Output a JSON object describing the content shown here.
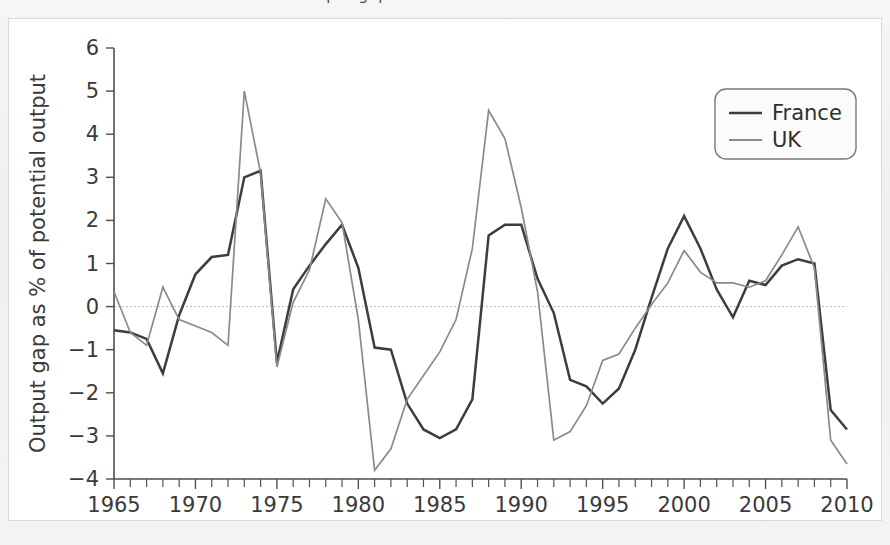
{
  "figure": {
    "cutoff_top_text": "output gap",
    "background_color": "#f2f2f2",
    "plate_color": "#ffffff"
  },
  "legend": {
    "position": "top-right",
    "entries": [
      {
        "label": "France",
        "color": "#3d3d3d",
        "width": 2.6
      },
      {
        "label": "UK",
        "color": "#8a8a8a",
        "width": 1.8
      }
    ]
  },
  "chart_data": {
    "type": "line",
    "title": "",
    "xlabel": "",
    "ylabel": "Output gap as % of potential output",
    "xlim": [
      1965,
      2010
    ],
    "ylim": [
      -4,
      6
    ],
    "grid": false,
    "zero_line": true,
    "legend_position": "top-right",
    "xticks": [
      1965,
      1970,
      1975,
      1980,
      1985,
      1990,
      1995,
      2000,
      2005,
      2010
    ],
    "xtick_labels": [
      "1965",
      "1970",
      "1975",
      "1980",
      "1985",
      "1990",
      "1995",
      "2000",
      "2005",
      "2010"
    ],
    "xminor_step": 1,
    "yticks": [
      -4,
      -3,
      -2,
      -1,
      0,
      1,
      2,
      3,
      4,
      5,
      6
    ],
    "ytick_labels": [
      "−4",
      "−3",
      "−2",
      "−1",
      "0",
      "1",
      "2",
      "3",
      "4",
      "5",
      "6"
    ],
    "x": [
      1965,
      1966,
      1967,
      1968,
      1969,
      1970,
      1971,
      1972,
      1973,
      1974,
      1975,
      1976,
      1977,
      1978,
      1979,
      1980,
      1981,
      1982,
      1983,
      1984,
      1985,
      1986,
      1987,
      1988,
      1989,
      1990,
      1991,
      1992,
      1993,
      1994,
      1995,
      1996,
      1997,
      1998,
      1999,
      2000,
      2001,
      2002,
      2003,
      2004,
      2005,
      2006,
      2007,
      2008,
      2009,
      2010
    ],
    "series": [
      {
        "name": "France",
        "color": "#3d3d3d",
        "values": [
          -0.55,
          -0.6,
          -0.75,
          -1.55,
          -0.2,
          0.75,
          1.15,
          1.2,
          3.0,
          3.15,
          -1.3,
          0.4,
          0.95,
          1.45,
          1.9,
          0.9,
          -0.95,
          -1.0,
          -2.25,
          -2.85,
          -3.05,
          -2.85,
          -2.15,
          1.65,
          1.9,
          1.9,
          0.65,
          -0.15,
          -1.7,
          -1.85,
          -2.25,
          -1.9,
          -1.0,
          0.2,
          1.35,
          2.1,
          1.35,
          0.4,
          -0.25,
          0.6,
          0.5,
          0.95,
          1.1,
          1.0,
          -2.4,
          -2.85
        ]
      },
      {
        "name": "UK",
        "color": "#8a8a8a",
        "values": [
          0.35,
          -0.6,
          -0.9,
          0.45,
          -0.3,
          -0.45,
          -0.6,
          -0.9,
          5.0,
          3.1,
          -1.4,
          0.1,
          0.85,
          2.5,
          1.95,
          -0.3,
          -3.8,
          -3.3,
          -2.15,
          -1.6,
          -1.05,
          -0.3,
          1.35,
          4.55,
          3.9,
          2.3,
          0.35,
          -3.1,
          -2.9,
          -2.3,
          -1.25,
          -1.1,
          -0.5,
          0.05,
          0.55,
          1.3,
          0.8,
          0.55,
          0.55,
          0.45,
          0.6,
          1.2,
          1.85,
          0.9,
          -3.1,
          -3.65
        ]
      }
    ]
  }
}
